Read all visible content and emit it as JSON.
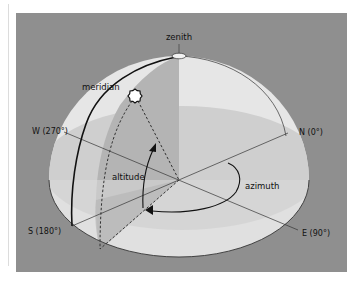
{
  "diagram": {
    "labels": {
      "zenith": "zenith",
      "meridian": "meridian",
      "altitude": "altitude",
      "azimuth": "azimuth",
      "north": "N (0°)",
      "east": "E (90°)",
      "south": "S (180°)",
      "west": "W (270°)"
    },
    "icons": {
      "star": "eight-point-star-outline",
      "zenith_marker": "ellipse"
    },
    "colors": {
      "background_panel": "#8f8f8f",
      "dome_upper": "#e4e4e4",
      "dome_lower": "#cdcdcd",
      "vertical_plane": "#b3b3b3",
      "lines": "#222222",
      "page": "#ffffff"
    }
  }
}
